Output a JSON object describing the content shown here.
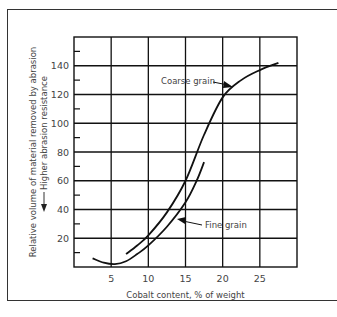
{
  "chart_data": {
    "type": "line",
    "title": "",
    "xlabel": "Cobalt content, % of weight",
    "ylabel": "Relative volume of material removed by abrasion",
    "ylabel_secondary": "Higher abrasion resistance",
    "xlim": [
      0,
      30
    ],
    "ylim": [
      0,
      160
    ],
    "x_ticks": [
      "5",
      "10",
      "15",
      "20",
      "25"
    ],
    "y_ticks": [
      "20",
      "40",
      "60",
      "80",
      "100",
      "120",
      "140"
    ],
    "grid": true,
    "legend": "annotations",
    "series": [
      {
        "name": "Coarse grain",
        "x": [
          7,
          8.5,
          10,
          12.5,
          15,
          17.5,
          20,
          22.5,
          25,
          27.5
        ],
        "y": [
          9,
          15,
          22,
          38,
          60,
          92,
          118,
          130,
          137,
          142
        ]
      },
      {
        "name": "Fine grain",
        "x": [
          2.5,
          4,
          5.5,
          7,
          8.5,
          10,
          12.5,
          15,
          16.5,
          17.5
        ],
        "y": [
          6,
          3,
          2,
          4,
          9,
          15,
          28,
          45,
          60,
          73
        ]
      }
    ],
    "annotations": [
      {
        "text": "Coarse grain",
        "points_to": "Coarse grain"
      },
      {
        "text": "Fine grain",
        "points_to": "Fine grain"
      }
    ]
  }
}
